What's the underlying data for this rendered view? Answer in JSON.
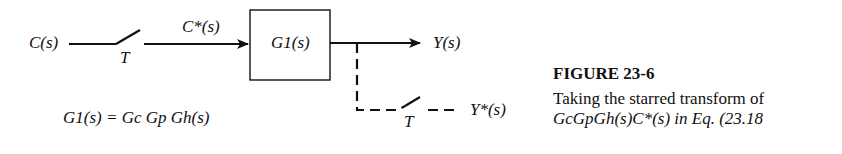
{
  "diagram": {
    "input_label": "C(s)",
    "sampler1_label": "T",
    "starred_input_label": "C*(s)",
    "block_label": "G1(s)",
    "output_label": "Y(s)",
    "sampler2_label": "T",
    "starred_output_label": "Y*(s)",
    "equation": "G1(s) = Gc Gp Gh(s)"
  },
  "caption": {
    "title": "FIGURE 23-6",
    "line1": "Taking the starred transform of",
    "line2": "GcGpGh(s)C*(s) in Eq. (23.18"
  }
}
